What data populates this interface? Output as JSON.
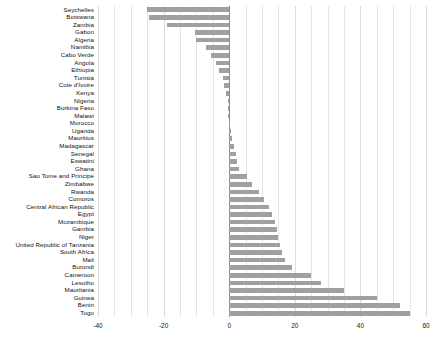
{
  "chart_data": {
    "type": "bar",
    "orientation": "horizontal",
    "title": "",
    "subtitle": "",
    "xlabel": "",
    "ylabel": "",
    "xlim": [
      -40,
      60
    ],
    "xticks": [
      -40,
      -20,
      0,
      20,
      40,
      60
    ],
    "xtick_labels": [
      "-40",
      "-20",
      "0",
      "20",
      "40",
      "60"
    ],
    "grid": true,
    "grid_minor_step": 5,
    "legend": null,
    "bar_color": "#a0a0a0",
    "zero_line_color": "#8a8a8a",
    "categories": [
      "Seychelles",
      "Botswana",
      "Zambia",
      "Gabon",
      "Algeria",
      "Namibia",
      "Cabo Verde",
      "Angola",
      "Ethiopia",
      "Tunisia",
      "Cote d'Ivoire",
      "Kenya",
      "Nigeria",
      "Burkina Faso",
      "Malawi",
      "Morocco",
      "Uganda",
      "Mauritius",
      "Madagascar",
      "Senegal",
      "Eswatini",
      "Ghana",
      "Sao Tome and Principe",
      "Zimbabwe",
      "Rwanda",
      "Comoros",
      "Central African Republic",
      "Egypt",
      "Mozambique",
      "Gambia",
      "Niger",
      "United Republic of Tanzania",
      "South Africa",
      "Mali",
      "Burundi",
      "Cameroon",
      "Lesotho",
      "Mauritania",
      "Guinea",
      "Benin",
      "Togo"
    ],
    "values": [
      -25.0,
      -24.5,
      -19.0,
      -10.5,
      -10.0,
      -7.0,
      -5.5,
      -4.0,
      -3.0,
      -2.0,
      -1.5,
      -1.0,
      -0.5,
      -0.4,
      -0.3,
      0.3,
      0.6,
      1.0,
      1.5,
      2.0,
      2.5,
      3.0,
      5.5,
      7.0,
      9.0,
      10.5,
      12.0,
      13.0,
      14.0,
      14.5,
      15.0,
      15.5,
      16.0,
      17.0,
      19.0,
      25.0,
      28.0,
      35.0,
      45.0,
      52.0,
      55.0
    ]
  }
}
